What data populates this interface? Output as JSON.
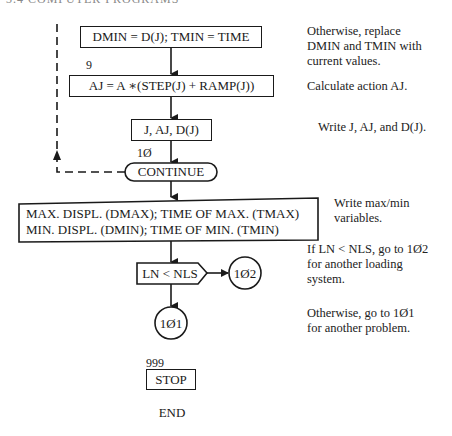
{
  "header": {
    "text": "3.4   COMPUTER PROGRAMS"
  },
  "flowchart": {
    "nodes": {
      "assign_min": {
        "text": "DMIN = D(J); TMIN = TIME"
      },
      "calc_action": {
        "label": "9",
        "text": "AJ = A ∗(STEP(J) + RAMP(J))"
      },
      "write_vals": {
        "text": "J, AJ, D(J)"
      },
      "continue": {
        "label": "1Ø",
        "text": "CONTINUE"
      },
      "output": {
        "line1": "MAX. DISPL. (DMAX); TIME OF MAX. (TMAX)",
        "line2": "MIN. DISPL. (DMIN); TIME OF MIN. (TMIN)"
      },
      "decision": {
        "text": "LN < NLS"
      },
      "connector_102": {
        "text": "1Ø2"
      },
      "connector_101": {
        "text": "1Ø1"
      },
      "stop": {
        "label": "999",
        "text": "STOP"
      },
      "end": {
        "text": "END"
      }
    }
  },
  "notes": {
    "n1": [
      "Otherwise, replace",
      "DMIN and TMIN with",
      "current values."
    ],
    "n2": [
      "Calculate action AJ."
    ],
    "n3": [
      "Write J, AJ, and D(J)."
    ],
    "n4": [
      "Write max/min",
      "variables."
    ],
    "n5": [
      "If LN < NLS, go to 1Ø2",
      "for another loading",
      "system."
    ],
    "n6": [
      "Otherwise, go to 1Ø1",
      "for another problem."
    ]
  },
  "colors": {
    "ink": "#1a1a1a",
    "background": "#ffffff"
  }
}
